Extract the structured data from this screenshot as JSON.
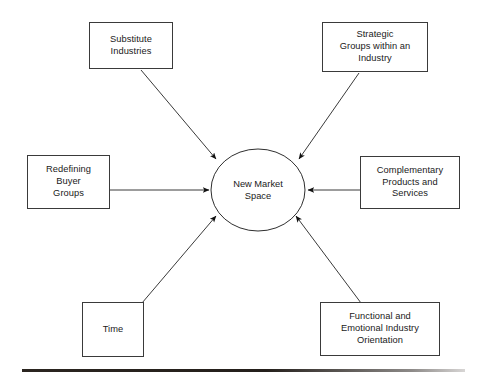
{
  "diagram": {
    "type": "hub-and-spoke",
    "center": {
      "id": "new-market-space",
      "label": "New Market\nSpace",
      "shape": "ellipse",
      "cx": 258,
      "cy": 190,
      "rx": 47,
      "ry": 41
    },
    "nodes": [
      {
        "id": "substitute-industries",
        "label": "Substitute\nIndustries",
        "x": 89,
        "y": 22,
        "w": 84,
        "h": 47,
        "position": "top-left"
      },
      {
        "id": "strategic-groups",
        "label": "Strategic\nGroups  within an\nIndustry",
        "x": 322,
        "y": 22,
        "w": 106,
        "h": 50,
        "position": "top-right"
      },
      {
        "id": "redefining-buyer-groups",
        "label": "Redefining\nBuyer\nGroups",
        "x": 27,
        "y": 155,
        "w": 83,
        "h": 54,
        "position": "left"
      },
      {
        "id": "complementary-products-services",
        "label": "Complementary\nProducts and\nServices",
        "x": 360,
        "y": 156,
        "w": 100,
        "h": 53,
        "position": "right"
      },
      {
        "id": "time",
        "label": "Time",
        "x": 82,
        "y": 302,
        "w": 62,
        "h": 55,
        "position": "bottom-left"
      },
      {
        "id": "functional-emotional-orientation",
        "label": "Functional  and\nEmotional Industry\nOrientation",
        "x": 320,
        "y": 302,
        "w": 120,
        "h": 54,
        "position": "bottom-right"
      }
    ],
    "arrows": [
      {
        "id": "arrow-substitute-industries",
        "from": "substitute-industries",
        "to": "new-market-space",
        "x1": 141,
        "y1": 70,
        "x2": 216,
        "y2": 159
      },
      {
        "id": "arrow-strategic-groups",
        "from": "strategic-groups",
        "to": "new-market-space",
        "x1": 359,
        "y1": 73,
        "x2": 299,
        "y2": 159
      },
      {
        "id": "arrow-redefining-buyer-groups",
        "from": "redefining-buyer-groups",
        "to": "new-market-space",
        "x1": 110,
        "y1": 190,
        "x2": 209,
        "y2": 190
      },
      {
        "id": "arrow-complementary-products",
        "from": "complementary-products-services",
        "to": "new-market-space",
        "x1": 360,
        "y1": 190,
        "x2": 308,
        "y2": 190
      },
      {
        "id": "arrow-time",
        "from": "time",
        "to": "new-market-space",
        "x1": 142,
        "y1": 303,
        "x2": 216,
        "y2": 216
      },
      {
        "id": "arrow-functional-emotional",
        "from": "functional-emotional-orientation",
        "to": "new-market-space",
        "x1": 361,
        "y1": 303,
        "x2": 296,
        "y2": 216
      }
    ],
    "footer_rule": {
      "x": 22,
      "y": 369,
      "w": 443,
      "h": 3
    }
  },
  "colors": {
    "background": "#ffffff",
    "stroke": "#3a3a3a",
    "text": "#1a1a1a",
    "rule": "#2b2520"
  }
}
